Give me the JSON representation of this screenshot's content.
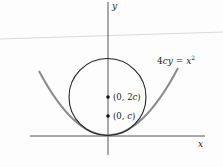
{
  "figure": {
    "axes": {
      "x_label": "x",
      "y_label": "y"
    },
    "curve_label": {
      "prefix": "4",
      "c": "c",
      "y": "y",
      "eq": " = ",
      "x": "x",
      "exp": "2",
      "full": "4cy = x^2"
    },
    "points": [
      {
        "label": "(0, 2c)",
        "open": "(0, 2",
        "var": "c",
        "close": ")"
      },
      {
        "label": "(0, c)",
        "open": "(0, ",
        "var": "c",
        "close": ")"
      }
    ],
    "colors": {
      "axis": "#555555",
      "circle": "#222222",
      "parabola": "#8a8a8a",
      "artifact": "#c8c8c8"
    }
  }
}
